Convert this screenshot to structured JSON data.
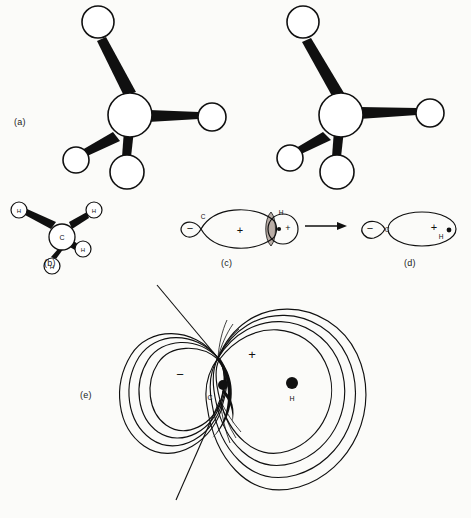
{
  "figure": {
    "width": 471,
    "height": 518,
    "background_color": "#fbfbf9",
    "ink_color": "#101010",
    "shade_color": "#b9ada6"
  },
  "panels": [
    {
      "id": "a",
      "label": "(a)",
      "kind": "ball-and-stick-model",
      "description": "Tetrahedral methane ball-and-stick model, unlabeled spheres",
      "center_atom": {
        "label": "",
        "cx": 130,
        "cy": 115,
        "r": 22
      },
      "outer_atoms": [
        {
          "label": "",
          "cx": 98,
          "cy": 22,
          "r": 16
        },
        {
          "label": "",
          "cx": 212,
          "cy": 117,
          "r": 14
        },
        {
          "label": "",
          "cx": 76,
          "cy": 160,
          "r": 13
        },
        {
          "label": "",
          "cx": 127,
          "cy": 172,
          "r": 17
        }
      ]
    },
    {
      "id": "a2",
      "label": "",
      "kind": "ball-and-stick-model",
      "description": "Second view of tetrahedral methane ball-and-stick model (stereo partner)",
      "center_atom": {
        "label": "",
        "cx": 341,
        "cy": 115,
        "r": 22
      },
      "outer_atoms": [
        {
          "label": "",
          "cx": 303,
          "cy": 22,
          "r": 16
        },
        {
          "label": "",
          "cx": 430,
          "cy": 113,
          "r": 14
        },
        {
          "label": "",
          "cx": 290,
          "cy": 158,
          "r": 13
        },
        {
          "label": "",
          "cx": 337,
          "cy": 172,
          "r": 17
        }
      ]
    },
    {
      "id": "b",
      "label": "(b)",
      "kind": "ball-and-stick-model-labeled",
      "description": "Tetrahedral methane with atoms labeled C and H",
      "center_atom": {
        "label": "C",
        "cx": 62,
        "cy": 237,
        "r": 13
      },
      "outer_atoms": [
        {
          "label": "H",
          "cx": 19,
          "cy": 210,
          "r": 8
        },
        {
          "label": "H",
          "cx": 94,
          "cy": 210,
          "r": 8
        },
        {
          "label": "H",
          "cx": 83,
          "cy": 249,
          "r": 8
        },
        {
          "label": "H",
          "cx": 52,
          "cy": 266,
          "r": 8
        }
      ]
    },
    {
      "id": "c",
      "label": "(c)",
      "kind": "orbital-overlap-before",
      "description": "Carbon sp3 hybrid orbital approaching a hydrogen 1s orbital",
      "annotations": [
        {
          "text": "C",
          "x": 203,
          "y": 216,
          "role": "atom-label"
        },
        {
          "text": "−",
          "x": 190,
          "y": 228,
          "role": "orbital-sign-minus"
        },
        {
          "text": "+",
          "x": 240,
          "y": 230,
          "role": "orbital-sign-plus"
        },
        {
          "text": "H",
          "x": 281,
          "y": 212,
          "role": "atom-label"
        },
        {
          "text": "+",
          "x": 286,
          "y": 226,
          "role": "orbital-sign-plus"
        }
      ]
    },
    {
      "id": "d",
      "label": "(d)",
      "kind": "orbital-overlap-after",
      "description": "Merged C–H sigma bonding orbital after overlap",
      "annotations": [
        {
          "text": "C",
          "x": 386,
          "y": 230,
          "role": "atom-label"
        },
        {
          "text": "−",
          "x": 367,
          "y": 229,
          "role": "orbital-sign-minus"
        },
        {
          "text": "+",
          "x": 434,
          "y": 228,
          "role": "orbital-sign-plus"
        },
        {
          "text": "H",
          "x": 441,
          "y": 237,
          "role": "atom-label"
        }
      ]
    },
    {
      "id": "e",
      "label": "(e)",
      "kind": "electron-density-contour-map",
      "description": "Contour map of the C–H sigma molecular orbital with a nodal plane through the carbon",
      "annotations": [
        {
          "text": "−",
          "x": 180,
          "y": 375,
          "role": "lobe-sign-minus"
        },
        {
          "text": "+",
          "x": 252,
          "y": 354,
          "role": "lobe-sign-plus"
        },
        {
          "text": "C",
          "x": 210,
          "y": 397,
          "role": "nucleus-label"
        },
        {
          "text": "H",
          "x": 292,
          "y": 398,
          "role": "nucleus-label"
        }
      ],
      "nuclei": [
        {
          "label": "C",
          "cx": 223,
          "cy": 385,
          "r": 5
        },
        {
          "label": "H",
          "cx": 292,
          "cy": 383,
          "r": 6
        }
      ],
      "contour_count": 4,
      "node_point": {
        "x": 218,
        "y": 358
      },
      "nodal_line": {
        "x1": 157,
        "y1": 285,
        "x2": 176,
        "y2": 500
      }
    }
  ],
  "reaction_arrow": {
    "name": "reaction-arrow",
    "x1": 305,
    "y1": 226,
    "x2": 347,
    "y2": 226,
    "direction": "right"
  }
}
